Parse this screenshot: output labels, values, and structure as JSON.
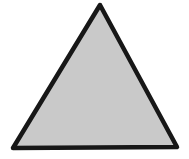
{
  "canvas": {
    "width": "189",
    "height": "159",
    "viewbox": "0 0 189 159",
    "background_color": "#ffffff"
  },
  "shape": {
    "kind": "triangle",
    "description": "isosceles triangle, thick black outline, light gray halftone fill",
    "points": "100,5 177,147 13,148",
    "fill_color": "#c9c9c9",
    "stroke_color": "#171717",
    "stroke_width": "4.5"
  }
}
